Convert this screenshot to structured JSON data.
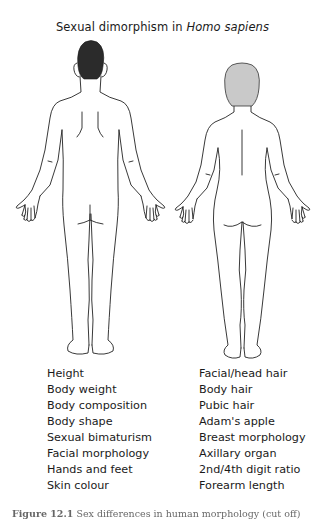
{
  "title": {
    "prefix": "Sexual dimorphism in ",
    "species": "Homo sapiens"
  },
  "figures": {
    "male": {
      "label": "male-figure-back-view",
      "hair_color": "#2b2b2b"
    },
    "female": {
      "label": "female-figure-back-view",
      "hair_color": "#c9c9c9"
    },
    "outline_color": "#222222"
  },
  "traits": {
    "left_column": [
      "Height",
      "Body weight",
      "Body composition",
      "Body shape",
      "Sexual bimaturism",
      "Facial morphology",
      "Hands and feet",
      "Skin colour"
    ],
    "right_column": [
      "Facial/head hair",
      "Body hair",
      "Pubic hair",
      "Adam's apple",
      "Breast morphology",
      "Axillary organ",
      "2nd/4th digit ratio",
      "Forearm length"
    ]
  },
  "caption": {
    "label": "Figure 12.1",
    "text": "Sex differences in human morphology (cut off)"
  }
}
